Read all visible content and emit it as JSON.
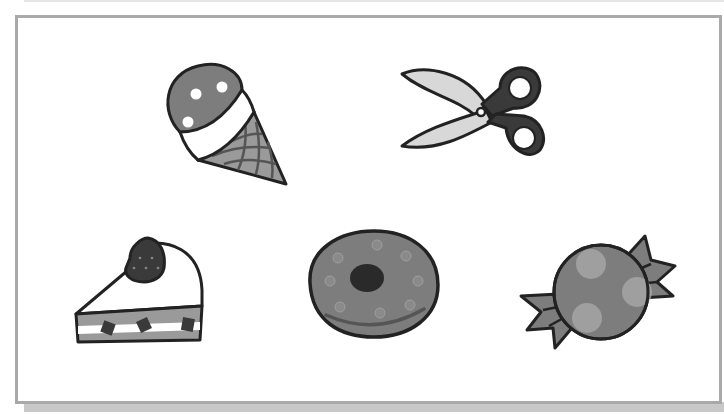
{
  "scene": {
    "frame": {
      "border_color": "#a9a9a9",
      "background": "#ffffff"
    },
    "items": [
      {
        "id": "ice-cream",
        "label": "ice cream cone",
        "icon": "ice-cream-icon"
      },
      {
        "id": "scissors",
        "label": "scissors",
        "icon": "scissors-icon"
      },
      {
        "id": "cake",
        "label": "strawberry cake slice",
        "icon": "cake-icon"
      },
      {
        "id": "cookie",
        "label": "cookie",
        "icon": "cookie-icon"
      },
      {
        "id": "candy",
        "label": "wrapped candy",
        "icon": "candy-icon"
      }
    ]
  },
  "colors": {
    "outline": "#222222",
    "dark_fill": "#3a3a3a",
    "mid_fill": "#7d7d7d",
    "light_fill": "#d8d8d8",
    "cone_fill": "#9a9a9a",
    "candy_spot": "#a8a8a8"
  }
}
